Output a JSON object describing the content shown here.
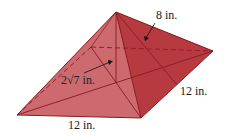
{
  "figure": {
    "type": "square pyramid",
    "colors": {
      "left_face": "#c95e64",
      "front_face": "#c75a60",
      "right_face": "#b8383e",
      "back_right_face": "#b03238",
      "edge": "#8a1a20",
      "dashed": "#9e1c24",
      "arrow": "#111111"
    },
    "labels": {
      "slant_height": "8 in.",
      "height": "2√7 in.",
      "right_base_edge": "12 in.",
      "front_base_edge": "12 in."
    }
  }
}
